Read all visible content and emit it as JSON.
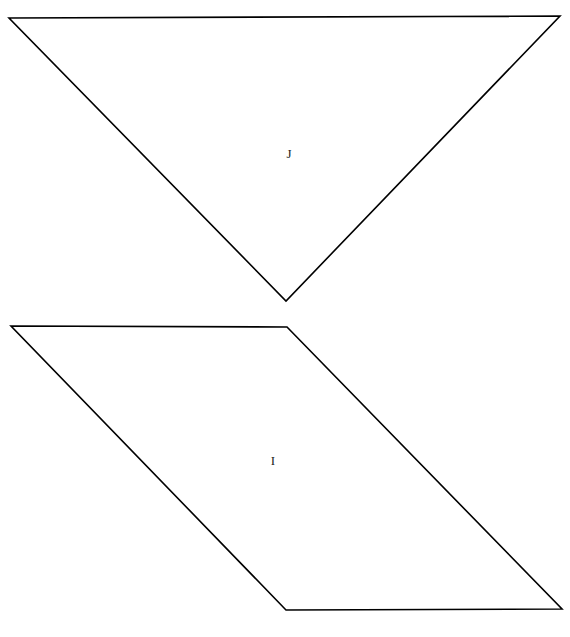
{
  "caption": {
    "text": "Shapes I and J (rotation)",
    "clipped": true
  },
  "figure": {
    "background_color": "#ffffff",
    "stroke_color": "#000000",
    "stroke_width": 1.6,
    "fill": "none",
    "shapes": [
      {
        "id": "shape-j",
        "label": "J",
        "kind": "inverted-triangle",
        "points": "9,18 560,16 286,301",
        "label_x": 289,
        "label_y": 158
      },
      {
        "id": "shape-i",
        "label": "I",
        "kind": "parallelogram",
        "points": "11,326 287,327 562,609 286,610",
        "label_x": 273,
        "label_y": 465
      }
    ]
  }
}
